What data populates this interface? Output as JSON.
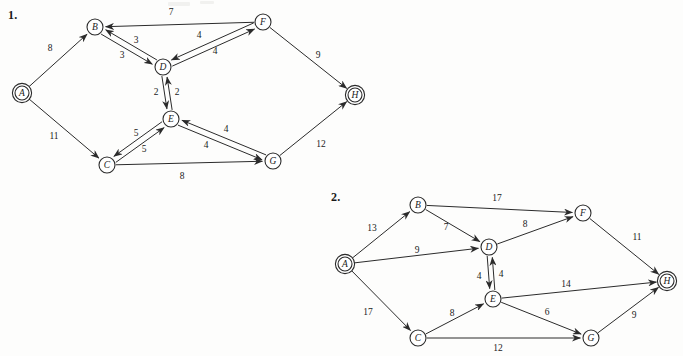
{
  "page": {
    "width": 683,
    "height": 356,
    "background": "#fdfdfc",
    "ink_color": "#2b2b2b"
  },
  "figures": [
    {
      "id": "figure-1",
      "number_label": "1.",
      "number_pos": [
        8,
        8
      ],
      "nodes": [
        {
          "id": "A",
          "label": "A",
          "x": 22,
          "y": 93,
          "double_ring": true
        },
        {
          "id": "B",
          "label": "B",
          "x": 95,
          "y": 27,
          "double_ring": false
        },
        {
          "id": "C",
          "label": "C",
          "x": 107,
          "y": 165,
          "double_ring": false
        },
        {
          "id": "D",
          "label": "D",
          "x": 163,
          "y": 67,
          "double_ring": false
        },
        {
          "id": "E",
          "label": "E",
          "x": 171,
          "y": 119,
          "double_ring": false
        },
        {
          "id": "F",
          "label": "F",
          "x": 263,
          "y": 22,
          "double_ring": false
        },
        {
          "id": "G",
          "label": "G",
          "x": 273,
          "y": 161,
          "double_ring": false
        },
        {
          "id": "H",
          "label": "H",
          "x": 355,
          "y": 95,
          "double_ring": true
        }
      ],
      "edges": [
        {
          "from": "A",
          "to": "B",
          "weight": "8",
          "label_pos": [
            50,
            48
          ],
          "offset": 0
        },
        {
          "from": "A",
          "to": "C",
          "weight": "11",
          "label_pos": [
            54,
            136
          ],
          "offset": 0
        },
        {
          "from": "B",
          "to": "D",
          "weight": "3",
          "label_pos": [
            122,
            55
          ],
          "offset": 3
        },
        {
          "from": "D",
          "to": "B",
          "weight": "3",
          "label_pos": [
            136,
            40
          ],
          "offset": 3
        },
        {
          "from": "F",
          "to": "B",
          "weight": "7",
          "label_pos": [
            171,
            12
          ],
          "offset": 0
        },
        {
          "from": "D",
          "to": "F",
          "weight": "4",
          "label_pos": [
            199,
            35
          ],
          "offset": 3
        },
        {
          "from": "F",
          "to": "D",
          "weight": "4",
          "label_pos": [
            215,
            51
          ],
          "offset": 3
        },
        {
          "from": "D",
          "to": "E",
          "weight": "2",
          "label_pos": [
            156,
            92
          ],
          "offset": 2.5
        },
        {
          "from": "E",
          "to": "D",
          "weight": "2",
          "label_pos": [
            177,
            92
          ],
          "offset": 2.5
        },
        {
          "from": "C",
          "to": "E",
          "weight": "5",
          "label_pos": [
            136,
            133
          ],
          "offset": 3
        },
        {
          "from": "E",
          "to": "C",
          "weight": "5",
          "label_pos": [
            144,
            149
          ],
          "offset": 3
        },
        {
          "from": "E",
          "to": "G",
          "weight": "4",
          "label_pos": [
            206,
            145
          ],
          "offset": 3
        },
        {
          "from": "G",
          "to": "E",
          "weight": "4",
          "label_pos": [
            226,
            129
          ],
          "offset": 3
        },
        {
          "from": "C",
          "to": "G",
          "weight": "8",
          "label_pos": [
            182,
            176
          ],
          "offset": 0
        },
        {
          "from": "F",
          "to": "H",
          "weight": "9",
          "label_pos": [
            318,
            55
          ],
          "offset": 0
        },
        {
          "from": "G",
          "to": "H",
          "weight": "12",
          "label_pos": [
            321,
            144
          ],
          "offset": 0
        }
      ]
    },
    {
      "id": "figure-2",
      "number_label": "2.",
      "number_pos": [
        331,
        190
      ],
      "nodes": [
        {
          "id": "A",
          "label": "A",
          "x": 345,
          "y": 264,
          "double_ring": true
        },
        {
          "id": "B",
          "label": "B",
          "x": 418,
          "y": 205,
          "double_ring": false
        },
        {
          "id": "C",
          "label": "C",
          "x": 418,
          "y": 338,
          "double_ring": false
        },
        {
          "id": "D",
          "label": "D",
          "x": 489,
          "y": 247,
          "double_ring": false
        },
        {
          "id": "E",
          "label": "E",
          "x": 493,
          "y": 299,
          "double_ring": false
        },
        {
          "id": "F",
          "label": "F",
          "x": 583,
          "y": 213,
          "double_ring": false
        },
        {
          "id": "G",
          "label": "G",
          "x": 591,
          "y": 338,
          "double_ring": false
        },
        {
          "id": "H",
          "label": "H",
          "x": 667,
          "y": 281,
          "double_ring": true
        }
      ],
      "edges": [
        {
          "from": "A",
          "to": "B",
          "weight": "13",
          "label_pos": [
            372,
            228
          ],
          "offset": 0
        },
        {
          "from": "A",
          "to": "D",
          "weight": "9",
          "label_pos": [
            417,
            250
          ],
          "offset": 0
        },
        {
          "from": "A",
          "to": "C",
          "weight": "17",
          "label_pos": [
            368,
            312
          ],
          "offset": 0
        },
        {
          "from": "B",
          "to": "F",
          "weight": "17",
          "label_pos": [
            497,
            198
          ],
          "offset": 0
        },
        {
          "from": "B",
          "to": "D",
          "weight": "7",
          "label_pos": [
            446,
            227
          ],
          "offset": 0
        },
        {
          "from": "D",
          "to": "F",
          "weight": "8",
          "label_pos": [
            525,
            224
          ],
          "offset": 0
        },
        {
          "from": "D",
          "to": "E",
          "weight": "4",
          "label_pos": [
            479,
            276
          ],
          "offset": 2.5
        },
        {
          "from": "E",
          "to": "D",
          "weight": "4",
          "label_pos": [
            501,
            274
          ],
          "offset": 2.5
        },
        {
          "from": "C",
          "to": "E",
          "weight": "8",
          "label_pos": [
            452,
            313
          ],
          "offset": 0
        },
        {
          "from": "E",
          "to": "H",
          "weight": "14",
          "label_pos": [
            566,
            284
          ],
          "offset": 0
        },
        {
          "from": "E",
          "to": "G",
          "weight": "6",
          "label_pos": [
            547,
            312
          ],
          "offset": 0
        },
        {
          "from": "C",
          "to": "G",
          "weight": "12",
          "label_pos": [
            498,
            348
          ],
          "offset": 0
        },
        {
          "from": "F",
          "to": "H",
          "weight": "11",
          "label_pos": [
            637,
            237
          ],
          "offset": 0
        },
        {
          "from": "G",
          "to": "H",
          "weight": "9",
          "label_pos": [
            634,
            315
          ],
          "offset": 0
        }
      ]
    }
  ]
}
